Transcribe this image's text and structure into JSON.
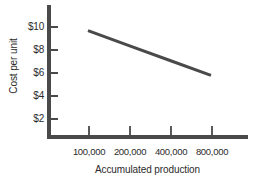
{
  "chart_data": {
    "type": "line",
    "title": "",
    "xlabel": "Accumulated production",
    "ylabel": "Cost per unit",
    "x_scale": "log2",
    "categories": [
      "100,000",
      "200,000",
      "400,000",
      "800,000"
    ],
    "x": [
      100000,
      200000,
      400000,
      800000
    ],
    "y_ticks": [
      2,
      4,
      6,
      8,
      10
    ],
    "y_tick_labels": [
      "$2",
      "$4",
      "$6",
      "$8",
      "$10"
    ],
    "ylim": [
      0,
      11
    ],
    "grid": false,
    "legend": null,
    "series": [
      {
        "name": "Unit cost",
        "values": [
          9.6,
          8.3,
          7.0,
          5.7
        ],
        "color": "#4a4a4a",
        "line_width": 3
      }
    ],
    "annotations": []
  },
  "axes": {
    "y_tick_labels": [
      "$10",
      "$8",
      "$6",
      "$4",
      "$2"
    ],
    "x_tick_labels": [
      "100,000",
      "200,000",
      "400,000",
      "800,000"
    ],
    "y_title": "Cost per unit",
    "x_title": "Accumulated production"
  },
  "colors": {
    "axis": "#4a4a4a",
    "line": "#4a4a4a",
    "text": "#2b2b2b",
    "background": "#ffffff"
  }
}
